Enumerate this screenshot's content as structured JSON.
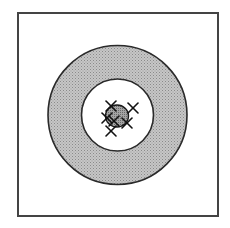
{
  "diagram": {
    "type": "concentric-target",
    "background": "#ffffff",
    "frame": {
      "x": 18,
      "y": 13,
      "width": 200,
      "height": 203,
      "stroke": "#444444",
      "stroke_width": 2
    },
    "center": {
      "x": 117.5,
      "y": 115
    },
    "outer_ring": {
      "radius": 69.5,
      "fill": "#b9b9b9",
      "stroke": "#2a2a2a",
      "stroke_width": 1.6,
      "pattern": "stippled"
    },
    "inner_circle": {
      "radius": 36,
      "fill": "#ffffff",
      "stroke": "#2a2a2a",
      "stroke_width": 1.6
    },
    "core": {
      "cx": 117,
      "cy": 116,
      "rx": 11.5,
      "ry": 11,
      "fill": "#9a9a9a",
      "stroke": "#1a1a1a",
      "stroke_width": 1.4,
      "pattern": "stippled-dark"
    },
    "marks": [
      {
        "x": 111,
        "y": 106,
        "size": 5
      },
      {
        "x": 133,
        "y": 108,
        "size": 5
      },
      {
        "x": 107,
        "y": 118,
        "size": 5
      },
      {
        "x": 114,
        "y": 121,
        "size": 5
      },
      {
        "x": 127,
        "y": 123,
        "size": 5
      },
      {
        "x": 111,
        "y": 131,
        "size": 5
      }
    ],
    "mark_color": "#111111",
    "mark_stroke_width": 1.6
  }
}
